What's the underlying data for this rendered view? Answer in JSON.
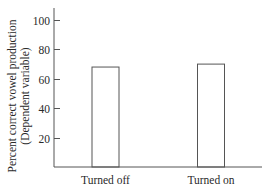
{
  "chart_data": {
    "type": "bar",
    "title": "",
    "xlabel": "",
    "ylabel": "Percent correct vowel production (Dependent variable)",
    "ylabel_lines": [
      "Percent correct vowel production",
      "(Dependent variable)"
    ],
    "categories": [
      "Turned off",
      "Turned on"
    ],
    "values": [
      68,
      70
    ],
    "ylim": [
      0,
      110
    ],
    "yticks": [
      20,
      40,
      60,
      80,
      100
    ],
    "grid": false,
    "legend": null,
    "bar_style": "unfilled outline"
  },
  "colors": {
    "axis": "#555555",
    "bar_outline": "#555555",
    "bar_fill": "#ffffff",
    "text": "#2a2a2a"
  }
}
